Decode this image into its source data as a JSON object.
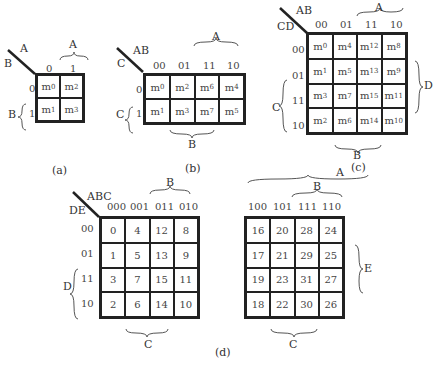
{
  "a": {
    "caption": "(a)",
    "row_var": "B",
    "col_var": "A",
    "col_codes": [
      "0",
      "1"
    ],
    "row_codes": [
      "0",
      "1"
    ],
    "brace_top": "A",
    "brace_left": "B",
    "cells": [
      [
        "m0",
        "m2"
      ],
      [
        "m1",
        "m3"
      ]
    ]
  },
  "b": {
    "caption": "(b)",
    "row_var": "C",
    "col_var": "AB",
    "col_codes": [
      "00",
      "01",
      "11",
      "10"
    ],
    "row_codes": [
      "0",
      "1"
    ],
    "brace_top": "A",
    "brace_left": "C",
    "brace_bottom": "B",
    "cells": [
      [
        "m0",
        "m2",
        "m6",
        "m4"
      ],
      [
        "m1",
        "m3",
        "m7",
        "m5"
      ]
    ]
  },
  "c": {
    "caption": "(c)",
    "row_var": "CD",
    "col_var": "AB",
    "col_codes": [
      "00",
      "01",
      "11",
      "10"
    ],
    "row_codes": [
      "00",
      "01",
      "11",
      "10"
    ],
    "brace_top": "A",
    "brace_left": "C",
    "brace_right": "D",
    "brace_bottom": "B",
    "cells": [
      [
        "m0",
        "m4",
        "m12",
        "m8"
      ],
      [
        "m1",
        "m5",
        "m13",
        "m9"
      ],
      [
        "m3",
        "m7",
        "m15",
        "m11"
      ],
      [
        "m2",
        "m6",
        "m14",
        "m10"
      ]
    ]
  },
  "d": {
    "caption": "(d)",
    "row_var": "DE",
    "col_var": "ABC",
    "left_col_codes": [
      "000",
      "001",
      "011",
      "010"
    ],
    "right_col_codes": [
      "100",
      "101",
      "111",
      "110"
    ],
    "row_codes": [
      "00",
      "01",
      "11",
      "10"
    ],
    "brace_top_A": "A",
    "brace_top_B_left": "B",
    "brace_top_B_right": "B",
    "brace_left": "D",
    "brace_right": "E",
    "brace_bottom_left": "C",
    "brace_bottom_right": "C",
    "left_cells": [
      [
        "0",
        "4",
        "12",
        "8"
      ],
      [
        "1",
        "5",
        "13",
        "9"
      ],
      [
        "3",
        "7",
        "15",
        "11"
      ],
      [
        "2",
        "6",
        "14",
        "10"
      ]
    ],
    "right_cells": [
      [
        "16",
        "20",
        "28",
        "24"
      ],
      [
        "17",
        "21",
        "29",
        "25"
      ],
      [
        "19",
        "23",
        "31",
        "27"
      ],
      [
        "18",
        "22",
        "30",
        "26"
      ]
    ]
  }
}
